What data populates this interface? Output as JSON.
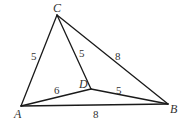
{
  "diagram": {
    "type": "geometry-figure",
    "vertices": [
      {
        "id": "A",
        "label": "A",
        "x": 21,
        "y": 106,
        "lx": 14,
        "ly": 118
      },
      {
        "id": "B",
        "label": "B",
        "x": 168,
        "y": 104,
        "lx": 170,
        "ly": 113
      },
      {
        "id": "C",
        "label": "C",
        "x": 57,
        "y": 15,
        "lx": 53,
        "ly": 12
      },
      {
        "id": "D",
        "label": "D",
        "x": 91,
        "y": 89,
        "lx": 79,
        "ly": 88
      }
    ],
    "edges": [
      {
        "id": "AC",
        "from": "A",
        "to": "C",
        "length": "5",
        "lx": 31,
        "ly": 60
      },
      {
        "id": "CD",
        "from": "C",
        "to": "D",
        "length": "5",
        "lx": 79,
        "ly": 57
      },
      {
        "id": "CB",
        "from": "C",
        "to": "B",
        "length": "8",
        "lx": 115,
        "ly": 60
      },
      {
        "id": "AD",
        "from": "A",
        "to": "D",
        "length": "6",
        "lx": 54,
        "ly": 94
      },
      {
        "id": "DB",
        "from": "D",
        "to": "B",
        "length": "5",
        "lx": 116,
        "ly": 94
      },
      {
        "id": "AB",
        "from": "A",
        "to": "B",
        "length": "8",
        "lx": 93,
        "ly": 118
      }
    ]
  }
}
